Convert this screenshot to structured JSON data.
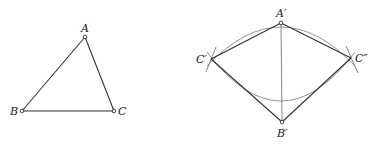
{
  "figure_left": {
    "title": "triangle ABC",
    "points": {
      "A": {
        "label": "A",
        "x": 85,
        "y": 37
      },
      "B": {
        "label": "B",
        "x": 22,
        "y": 111
      },
      "C": {
        "label": "C",
        "x": 114,
        "y": 111
      }
    }
  },
  "figure_right": {
    "title": "construction with arcs",
    "points": {
      "A1": {
        "label": "A′",
        "x": 281,
        "y": 23
      },
      "B1": {
        "label": "B′",
        "x": 282,
        "y": 122
      },
      "C1": {
        "label": "C′",
        "x": 211,
        "y": 59
      },
      "C2": {
        "label": "C″",
        "x": 351,
        "y": 58
      }
    }
  },
  "colors": {
    "line": "#333333",
    "arc": "#888888",
    "background": "#ffffff"
  }
}
